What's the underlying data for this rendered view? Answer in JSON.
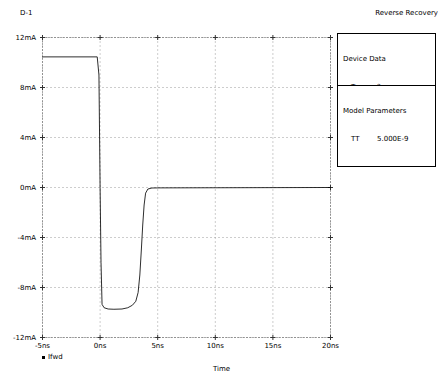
{
  "header": {
    "device_name": "D-1",
    "title": "Reverse Recovery"
  },
  "panels": {
    "device_data": {
      "title": "Device Data",
      "rows": [
        {
          "key": "Trr",
          "value": "?"
        },
        {
          "key": "Ifwd",
          "value": "10.00E-3"
        },
        {
          "key": "Irev",
          "value": "10.00E-3"
        },
        {
          "key": "Rl",
          "value": "100"
        }
      ]
    },
    "model_parameters": {
      "title": "Model Parameters",
      "rows": [
        {
          "key": "TT",
          "value": "5.000E-9"
        }
      ]
    }
  },
  "chart_data": {
    "type": "line",
    "title": "Reverse Recovery",
    "xlabel": "Time",
    "ylabel": "",
    "xlim": [
      -5,
      20
    ],
    "ylim": [
      -12,
      12
    ],
    "xunit": "ns",
    "yunit": "mA",
    "grid": true,
    "grid_style": "dotted",
    "legend_position": "bottom-left",
    "xticks": [
      -5,
      0,
      5,
      10,
      15,
      20
    ],
    "xticklabels": [
      "-5ns",
      "0ns",
      "5ns",
      "10ns",
      "15ns",
      "20ns"
    ],
    "yticks": [
      12,
      8,
      4,
      0,
      -4,
      -8,
      -12
    ],
    "yticklabels": [
      "12mA",
      "8mA",
      "4mA",
      "0mA",
      "-4mA",
      "-8mA",
      "-12mA"
    ],
    "series": [
      {
        "name": "Ifwd",
        "marker": "square",
        "color": "#000000",
        "points": [
          [
            -5.0,
            10.45
          ],
          [
            -0.25,
            10.45
          ],
          [
            -0.1,
            9.0
          ],
          [
            0.0,
            0.0
          ],
          [
            0.08,
            -6.0
          ],
          [
            0.17,
            -9.35
          ],
          [
            0.35,
            -9.62
          ],
          [
            0.7,
            -9.72
          ],
          [
            1.2,
            -9.74
          ],
          [
            1.9,
            -9.72
          ],
          [
            2.4,
            -9.62
          ],
          [
            2.8,
            -9.42
          ],
          [
            3.1,
            -9.1
          ],
          [
            3.3,
            -8.4
          ],
          [
            3.45,
            -7.0
          ],
          [
            3.58,
            -5.0
          ],
          [
            3.7,
            -3.0
          ],
          [
            3.82,
            -1.4
          ],
          [
            3.95,
            -0.45
          ],
          [
            4.15,
            -0.12
          ],
          [
            4.5,
            -0.04
          ],
          [
            5.2,
            -0.03
          ],
          [
            10.0,
            -0.02
          ],
          [
            20.0,
            0.0
          ]
        ]
      }
    ]
  }
}
